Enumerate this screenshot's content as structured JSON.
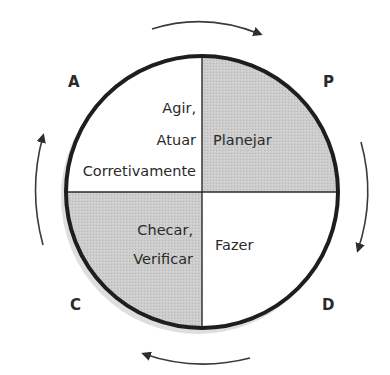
{
  "diagram": {
    "type": "PDCA cycle",
    "colors": {
      "shaded_quadrant": "#c9c9c9",
      "outline": "#1e1e1e",
      "arrows": "#3a3a3a",
      "shadow": "#bdbdbd"
    },
    "corner_letters": {
      "top_left": "A",
      "top_right": "P",
      "bottom_left": "C",
      "bottom_right": "D"
    },
    "quadrants": {
      "top_left": {
        "lines": [
          "Agir,",
          "Atuar",
          "Corretivamente"
        ],
        "shaded": false
      },
      "top_right": {
        "lines": [
          "Planejar"
        ],
        "shaded": true
      },
      "bottom_left": {
        "lines": [
          "Checar,",
          "Verificar"
        ],
        "shaded": true
      },
      "bottom_right": {
        "lines": [
          "Fazer"
        ],
        "shaded": false
      }
    },
    "arrows": [
      {
        "position": "top",
        "direction": "clockwise"
      },
      {
        "position": "right",
        "direction": "clockwise"
      },
      {
        "position": "bottom",
        "direction": "clockwise"
      },
      {
        "position": "left",
        "direction": "clockwise"
      }
    ]
  }
}
